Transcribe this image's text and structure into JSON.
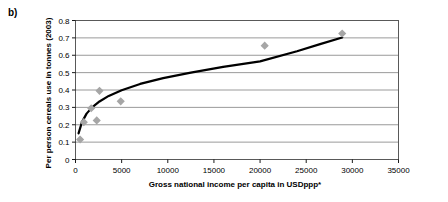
{
  "figure": {
    "panel_label": "b)"
  },
  "chart_data": {
    "type": "scatter",
    "title": "",
    "xlabel": "Gross national income per capita in USDppp*",
    "ylabel": "Per person cereals use in tonnes (2003)",
    "xlim": [
      0,
      35000
    ],
    "ylim": [
      0,
      0.8
    ],
    "xticks": [
      0,
      5000,
      10000,
      15000,
      20000,
      25000,
      30000,
      35000
    ],
    "xtick_labels": [
      "0",
      "5000",
      "10000",
      "15000",
      "20000",
      "25000",
      "30000",
      "35000"
    ],
    "yticks": [
      0,
      0.1,
      0.2,
      0.3,
      0.4,
      0.5,
      0.6,
      0.7,
      0.8
    ],
    "ytick_labels": [
      "0",
      "0.1",
      "0.2",
      "0.3",
      "0.4",
      "0.5",
      "0.6",
      "0.7",
      "0.8"
    ],
    "grid": "horizontal",
    "legend": "none",
    "marker": {
      "shape": "diamond",
      "color": "#a6a6a6",
      "size": 5
    },
    "series": [
      {
        "name": "Countries",
        "type": "scatter",
        "points": [
          {
            "x": 500,
            "y": 0.115
          },
          {
            "x": 900,
            "y": 0.215
          },
          {
            "x": 1700,
            "y": 0.295
          },
          {
            "x": 2300,
            "y": 0.225
          },
          {
            "x": 2600,
            "y": 0.395
          },
          {
            "x": 4900,
            "y": 0.335
          },
          {
            "x": 20500,
            "y": 0.655
          },
          {
            "x": 28900,
            "y": 0.725
          }
        ]
      },
      {
        "name": "Logarithmic trend line",
        "type": "line",
        "color": "#000000",
        "width": 2.2,
        "points": [
          {
            "x": 330,
            "y": 0.15
          },
          {
            "x": 700,
            "y": 0.215
          },
          {
            "x": 1200,
            "y": 0.264
          },
          {
            "x": 1800,
            "y": 0.3
          },
          {
            "x": 2600,
            "y": 0.334
          },
          {
            "x": 3600,
            "y": 0.366
          },
          {
            "x": 5000,
            "y": 0.399
          },
          {
            "x": 7000,
            "y": 0.435
          },
          {
            "x": 9500,
            "y": 0.468
          },
          {
            "x": 12500,
            "y": 0.5
          },
          {
            "x": 16000,
            "y": 0.533
          },
          {
            "x": 20000,
            "y": 0.565
          },
          {
            "x": 24000,
            "y": 0.623
          },
          {
            "x": 26500,
            "y": 0.664
          },
          {
            "x": 28900,
            "y": 0.702
          }
        ]
      }
    ]
  }
}
